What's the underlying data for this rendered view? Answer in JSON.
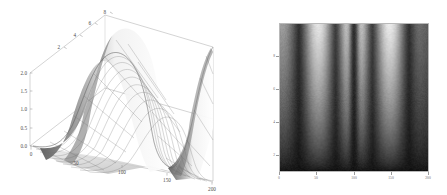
{
  "figure": {
    "panels": [
      "surface-3d",
      "density-plot"
    ],
    "background": "#ffffff",
    "line_color": "#555555"
  },
  "chart_data": [
    {
      "type": "surface",
      "title": "",
      "xlabel": "",
      "ylabel": "",
      "zlabel": "",
      "xticks": [
        "0",
        "50",
        "100",
        "150",
        "200"
      ],
      "xlim": [
        0,
        200
      ],
      "yticks": [
        "2",
        "4",
        "6",
        "8"
      ],
      "ylim": [
        0,
        9
      ],
      "zticks": [
        "0.0",
        "0.5",
        "1.0",
        "1.5",
        "2.0"
      ],
      "zlim": [
        0,
        2
      ],
      "grid": true,
      "mesh": true,
      "colormap": "grayscale",
      "description": "Two Gaussian-enveloped ridges rising from a flat base; amplitude grows with the depth axis.",
      "series": [
        {
          "name": "ridge-1",
          "peak_x": 100,
          "peak_z": 2.0
        },
        {
          "name": "ridge-2",
          "peak_x": 200,
          "peak_z": 2.0
        }
      ]
    },
    {
      "type": "heatmap",
      "title": "",
      "xlabel": "",
      "ylabel": "",
      "xticks": [
        "0",
        "50",
        "100",
        "150",
        "200"
      ],
      "xlim": [
        0,
        200
      ],
      "yticks": [
        "2",
        "4",
        "6",
        "8"
      ],
      "ylim": [
        0,
        9
      ],
      "grid": false,
      "colormap": "grayscale",
      "zlim": [
        0,
        2
      ],
      "description": "Bright at top fading to dark at bottom; sharp dark vertical band at x=100 flanked by two bright bands.",
      "bands": [
        {
          "name": "bright-left",
          "x": 55
        },
        {
          "name": "dark-center",
          "x": 100
        },
        {
          "name": "bright-right",
          "x": 150
        },
        {
          "name": "dark-right-edge",
          "x": 200
        }
      ]
    }
  ]
}
